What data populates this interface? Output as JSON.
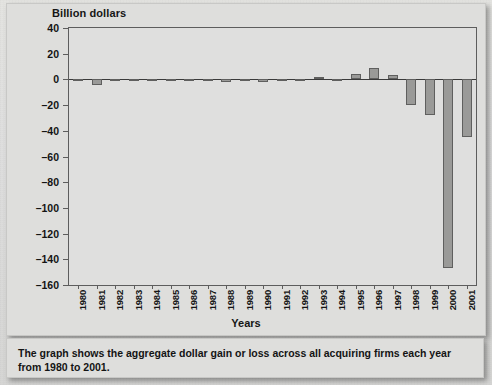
{
  "figure": {
    "y_axis_title": "Billion dollars",
    "x_axis_title": "Years",
    "caption": "The graph shows the aggregate dollar gain or loss across all acquiring firms each year from 1980 to 2001.",
    "bar_fill_color": "#9a9a98",
    "bar_stroke_color": "#5f5f5e",
    "axis_color": "#5d5d5d",
    "background_color": "#dededc"
  },
  "chart_data": {
    "type": "bar",
    "title": "",
    "xlabel": "Years",
    "ylabel": "Billion dollars",
    "ylim": [
      -160,
      40
    ],
    "ytick_step": 20,
    "grid": false,
    "legend": "none",
    "categories": [
      "1980",
      "1981",
      "1982",
      "1983",
      "1984",
      "1985",
      "1986",
      "1987",
      "1988",
      "1989",
      "1990",
      "1991",
      "1992",
      "1993",
      "1994",
      "1995",
      "1996",
      "1997",
      "1998",
      "1999",
      "2000",
      "2001"
    ],
    "yticklabels": [
      "40",
      "20",
      "0",
      "–20",
      "–40",
      "–60",
      "–80",
      "–100",
      "–120",
      "–140",
      "–160"
    ],
    "yticks": [
      40,
      20,
      0,
      -20,
      -40,
      -60,
      -80,
      -100,
      -120,
      -140,
      -160
    ],
    "values": [
      -1.5,
      -4.0,
      0.5,
      -1.0,
      -1.0,
      -1.0,
      -1.0,
      -0.8,
      -2.0,
      -1.5,
      -2.0,
      0.5,
      -1.5,
      1.5,
      -1.5,
      4.0,
      9.0,
      3.5,
      -20.0,
      -28.0,
      -147.0,
      -45.0
    ],
    "series_name": "Aggregate dollar gain or loss"
  }
}
